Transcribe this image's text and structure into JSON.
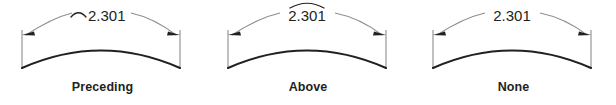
{
  "figure": {
    "background_color": "#ffffff",
    "dimension_line_color": "#8d8d8d",
    "object_line_color": "#231f20",
    "text_color": "#231f20",
    "panels": [
      {
        "id": "preceding",
        "caption": "Preceding",
        "dimension_value": "2.301",
        "arc_symbol": "⌒",
        "arc_symbol_name": "arc-length-symbol",
        "arc_symbol_placement": "preceding",
        "arc_symbol_visible": true
      },
      {
        "id": "above",
        "caption": "Above",
        "dimension_value": "2.301",
        "arc_symbol": "⌒",
        "arc_symbol_name": "arc-length-symbol",
        "arc_symbol_placement": "above",
        "arc_symbol_visible": true
      },
      {
        "id": "none",
        "caption": "None",
        "dimension_value": "2.301",
        "arc_symbol": "",
        "arc_symbol_name": "arc-length-symbol",
        "arc_symbol_placement": "none",
        "arc_symbol_visible": false
      }
    ]
  }
}
